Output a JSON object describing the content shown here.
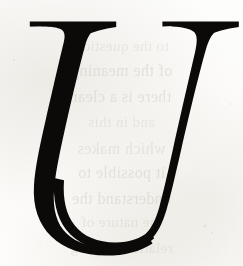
{
  "page": {
    "kind": "scanned-initial-capital",
    "width": 243,
    "height": 266,
    "background_color": "#fdfdfc",
    "paper_tint": "#f7f4ef",
    "alt_text": "Large italic serif capital letter U"
  },
  "glyph": {
    "character": "U",
    "case": "uppercase",
    "style": "italic",
    "typeface_class": "serif",
    "ink_color": "#0b0a09",
    "role": "drop-cap",
    "name": "initial-capital-u",
    "bounds": {
      "x": 18,
      "y": 21,
      "width": 221,
      "height": 231
    },
    "strokes": {
      "left_stem_label": "thick-stem",
      "right_stem_label": "thin-stem",
      "bowl_label": "bottom-bowl",
      "left_serif_label": "left-top-serif",
      "right_serif_label": "right-top-serif"
    }
  },
  "bleed_through": {
    "visible": true,
    "color": "#b9b3a9",
    "description": "faint mirrored show-through text from reverse side of page",
    "lines": [
      {
        "text": "to the question",
        "top": 38,
        "size": 15,
        "opacity": 0.22
      },
      {
        "text": "of the meaning",
        "top": 62,
        "size": 16,
        "opacity": 0.3
      },
      {
        "text": "there is a clear",
        "top": 88,
        "size": 16,
        "opacity": 0.28
      },
      {
        "text": "and in this",
        "top": 114,
        "size": 15,
        "opacity": 0.22
      },
      {
        "text": "which makes",
        "top": 140,
        "size": 16,
        "opacity": 0.26
      },
      {
        "text": "it possible to",
        "top": 164,
        "size": 16,
        "opacity": 0.28
      },
      {
        "text": "understand the",
        "top": 190,
        "size": 16,
        "opacity": 0.3
      },
      {
        "text": "the nature of",
        "top": 214,
        "size": 15,
        "opacity": 0.24
      },
      {
        "text": "relations among",
        "top": 240,
        "size": 15,
        "opacity": 0.22
      }
    ]
  },
  "noise": {
    "speckles": [
      {
        "x": 205,
        "y": 226,
        "r": 1.6,
        "o": 0.22
      },
      {
        "x": 212,
        "y": 233,
        "r": 1.1,
        "o": 0.18
      },
      {
        "x": 14,
        "y": 60,
        "r": 1.3,
        "o": 0.16
      },
      {
        "x": 231,
        "y": 104,
        "r": 1.0,
        "o": 0.14
      },
      {
        "x": 96,
        "y": 256,
        "r": 1.2,
        "o": 0.15
      },
      {
        "x": 40,
        "y": 246,
        "r": 1.0,
        "o": 0.13
      }
    ]
  }
}
